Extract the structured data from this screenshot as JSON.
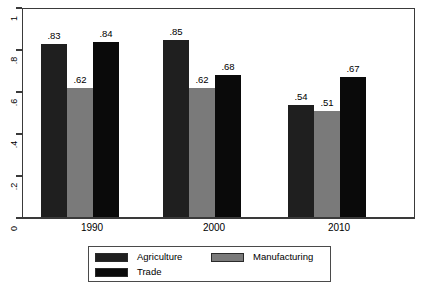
{
  "chart_data": {
    "type": "bar",
    "title": "",
    "subtitle": "",
    "xlabel": "",
    "ylabel": "",
    "categories": [
      "1990",
      "2000",
      "2010"
    ],
    "series": [
      {
        "name": "Agriculture",
        "color": "#1f1f1f",
        "values": [
          0.83,
          0.85,
          0.54
        ],
        "labels": [
          ".83",
          ".85",
          ".54"
        ]
      },
      {
        "name": "Manufacturing",
        "color": "#7a7a7a",
        "values": [
          0.62,
          0.62,
          0.51
        ],
        "labels": [
          ".62",
          ".62",
          ".51"
        ]
      },
      {
        "name": "Trade",
        "color": "#0a0a0a",
        "values": [
          0.84,
          0.68,
          0.67
        ],
        "labels": [
          ".84",
          ".68",
          ".67"
        ]
      }
    ],
    "ylim": [
      0,
      1
    ],
    "yticks": [
      0,
      0.2,
      0.4,
      0.6,
      0.8,
      1
    ],
    "ytick_labels": [
      "0",
      ".2",
      ".4",
      ".6",
      ".8",
      "1"
    ],
    "grid": false,
    "legend_position": "bottom",
    "legend_entries": [
      "Agriculture",
      "Manufacturing",
      "Trade"
    ],
    "bar_label_format": "leading-dot-2dp"
  },
  "axes": {
    "y_ticks": [
      {
        "label": "1",
        "value": 1.0
      },
      {
        "label": ".8",
        "value": 0.8
      },
      {
        "label": ".6",
        "value": 0.6
      },
      {
        "label": ".4",
        "value": 0.4
      },
      {
        "label": ".2",
        "value": 0.2
      },
      {
        "label": "0",
        "value": 0.0
      }
    ],
    "x_labels": [
      "1990",
      "2000",
      "2010"
    ]
  },
  "legend": {
    "items": [
      {
        "label": "Agriculture",
        "color": "#1f1f1f"
      },
      {
        "label": "Manufacturing",
        "color": "#7a7a7a"
      },
      {
        "label": "Trade",
        "color": "#0a0a0a"
      }
    ]
  }
}
